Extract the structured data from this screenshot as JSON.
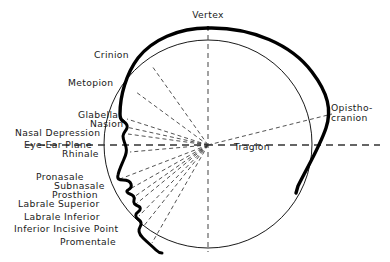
{
  "figure": {
    "type": "diagram",
    "background_color": "#ffffff",
    "ink_color": "#000000",
    "line_styles": {
      "head_outline": "solid-thick",
      "reference_circle": "solid-thin",
      "landmark_rays": "dashed-thin",
      "vertical_axis": "dashed-thin",
      "eye_ear_plane": "dashed-thin"
    }
  },
  "center_point": {
    "name": "Tragion",
    "label": "Tragion",
    "x": 208,
    "y": 145
  },
  "labels": {
    "vertex": "Vertex",
    "crinion": "Crinion",
    "metopion": "Metopion",
    "glabella": "Glabella",
    "nasion": "Nasion",
    "nasal_depression": "Nasal Depression",
    "eye_ear_plane": "Eye-Ear Plane",
    "rhinale": "Rhinale",
    "pronasale": "Pronasale",
    "subnasale": "Subnasale",
    "prosthion": "Prosthion",
    "labrale_superior": "Labrale Superior",
    "labrale_inferior": "Labrale Inferior",
    "inferior_incisive_point": "Inferior Incisive Point",
    "promentale": "Promentale",
    "opisthocranion_line1": "Opistho-",
    "opisthocranion_line2": "cranion",
    "tragion": "Tragion"
  },
  "landmarks": [
    {
      "name": "Vertex",
      "label": "Vertex",
      "side": "top",
      "x": 208,
      "y": 28
    },
    {
      "name": "Crinion",
      "label": "Crinion",
      "side": "left",
      "x": 146,
      "y": 63
    },
    {
      "name": "Metopion",
      "label": "Metopion",
      "side": "left",
      "x": 130,
      "y": 90
    },
    {
      "name": "Glabella",
      "label": "Glabella",
      "side": "left",
      "x": 123,
      "y": 118
    },
    {
      "name": "Nasion",
      "label": "Nasion",
      "side": "left",
      "x": 122,
      "y": 126
    },
    {
      "name": "Nasal Depression",
      "label": "Nasal Depression",
      "side": "left",
      "x": 124,
      "y": 133
    },
    {
      "name": "Eye-Ear Plane",
      "label": "Eye-Ear Plane",
      "side": "left",
      "x": 118,
      "y": 145
    },
    {
      "name": "Rhinale",
      "label": "Rhinale",
      "side": "left",
      "x": 124,
      "y": 151
    },
    {
      "name": "Pronasale",
      "label": "Pronasale",
      "side": "left",
      "x": 116,
      "y": 178
    },
    {
      "name": "Subnasale",
      "label": "Subnasale",
      "side": "left",
      "x": 126,
      "y": 188
    },
    {
      "name": "Prosthion",
      "label": "Prosthion",
      "side": "left",
      "x": 129,
      "y": 196
    },
    {
      "name": "Labrale Superior",
      "label": "Labrale Superior",
      "side": "left",
      "x": 131,
      "y": 203
    },
    {
      "name": "Labrale Inferior",
      "label": "Labrale Inferior",
      "side": "left",
      "x": 133,
      "y": 215
    },
    {
      "name": "Inferior Incisive Point",
      "label": "Inferior Incisive Point",
      "side": "left",
      "x": 137,
      "y": 226
    },
    {
      "name": "Promentale",
      "label": "Promentale",
      "side": "left",
      "x": 146,
      "y": 242
    },
    {
      "name": "Opisthocranion",
      "label": "Opistho-cranion",
      "side": "right",
      "x": 330,
      "y": 113
    },
    {
      "name": "Tragion",
      "label": "Tragion",
      "side": "center",
      "x": 208,
      "y": 145
    }
  ],
  "label_positions": {
    "vertex": {
      "left": 186,
      "top": 10,
      "align": "center"
    },
    "crinion": {
      "left": 94,
      "top": 50,
      "align": "left"
    },
    "metopion": {
      "left": 68,
      "top": 78,
      "align": "left"
    },
    "glabella": {
      "left": 78,
      "top": 110,
      "align": "left"
    },
    "nasion": {
      "left": 90,
      "top": 119,
      "align": "left"
    },
    "nasal_depression": {
      "left": 15,
      "top": 128,
      "align": "left"
    },
    "eye_ear_plane": {
      "left": 24,
      "top": 140,
      "align": "left"
    },
    "rhinale": {
      "left": 62,
      "top": 149,
      "align": "left"
    },
    "pronasale": {
      "left": 36,
      "top": 172,
      "align": "left"
    },
    "subnasale": {
      "left": 54,
      "top": 181,
      "align": "left"
    },
    "prosthion": {
      "left": 52,
      "top": 190,
      "align": "left"
    },
    "labrale_superior": {
      "left": 18,
      "top": 199,
      "align": "left"
    },
    "labrale_inferior": {
      "left": 24,
      "top": 212,
      "align": "left"
    },
    "inferior_incisive_point": {
      "left": 14,
      "top": 224,
      "align": "left"
    },
    "promentale": {
      "left": 60,
      "top": 237,
      "align": "left"
    },
    "opisthocranion": {
      "left": 331,
      "top": 103,
      "align": "left"
    },
    "tragion": {
      "left": 234,
      "top": 142,
      "align": "left"
    }
  },
  "geometry": {
    "reference_circle": {
      "cx": 208,
      "cy": 144,
      "r": 104
    },
    "vertical_axis": {
      "x": 208,
      "y_top": 26,
      "y_bottom": 252
    },
    "eye_ear_plane": {
      "y": 145,
      "x_left": 26,
      "x_right": 380
    }
  },
  "rays": [
    {
      "to": "Crinion",
      "x2": 152,
      "y2": 66
    },
    {
      "to": "Metopion",
      "x2": 136,
      "y2": 92
    },
    {
      "to": "Glabella",
      "x2": 127,
      "y2": 119
    },
    {
      "to": "Nasion",
      "x2": 126,
      "y2": 127
    },
    {
      "to": "Nasal Depression",
      "x2": 128,
      "y2": 134
    },
    {
      "to": "Rhinale",
      "x2": 130,
      "y2": 152
    },
    {
      "to": "Pronasale",
      "x2": 120,
      "y2": 179
    },
    {
      "to": "Subnasale",
      "x2": 130,
      "y2": 189
    },
    {
      "to": "Prosthion",
      "x2": 134,
      "y2": 197
    },
    {
      "to": "Labrale Superior",
      "x2": 136,
      "y2": 204
    },
    {
      "to": "Labrale Inferior",
      "x2": 139,
      "y2": 216
    },
    {
      "to": "Inferior Incisive Point",
      "x2": 143,
      "y2": 227
    },
    {
      "to": "Promentale",
      "x2": 152,
      "y2": 243
    },
    {
      "to": "Opisthocranion",
      "x2": 332,
      "y2": 114
    }
  ]
}
